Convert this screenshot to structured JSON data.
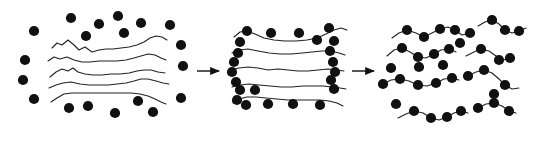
{
  "figure": {
    "type": "schematic-diagram",
    "width": 542,
    "height": 142,
    "background_color": "#ffffff",
    "ink_color": "#111111",
    "chain_stroke_color": "#222222",
    "chain_stroke_width": 1.1,
    "particle_fill": "#111111",
    "particle_radius": 5.1,
    "panel_count": 3,
    "arrow_count": 2,
    "has_text_labels": false
  },
  "panels": [
    {
      "id": "panel-1",
      "name": "immiscible-phase-separated-state",
      "caption": "",
      "chains": [
        "M 52 48 L 57 43 L 62 45 L 68 40 L 74 45 L 79 50 L 85 47 L 92 52 L 99 50 L 106 49 L 113 49 L 121 48 L 129 47 L 137 45 L 144 42 L 150 38 L 156 36 L 162 37 L 167 40",
        "M 48 61 L 54 57 L 60 59 L 67 57 L 74 60 L 82 62 L 90 62 L 99 61 L 108 61 L 117 61 L 126 60 L 134 58 L 141 56 L 148 54 L 155 55 L 161 58 L 166 60",
        "M 50 77 L 56 72 L 62 69 L 68 71 L 73 68 L 78 72 L 85 74 L 93 75 L 102 75 L 111 74 L 120 74 L 129 73 L 137 71 L 144 70 L 151 70 L 158 72 L 165 73",
        "M 49 88 L 56 85 L 63 83 L 71 82 L 80 84 L 89 85 L 98 85 L 108 85 L 117 84 L 126 83 L 134 81 L 141 79 L 148 79 L 156 81 L 163 83 L 169 84",
        "M 51 102 L 57 98 L 64 94 L 72 93 L 81 93 L 91 93 L 101 93 L 111 93 L 121 93 L 131 93 L 140 94 L 148 96 L 155 99 L 161 102 L 166 104"
      ],
      "particles": [
        {
          "cx": 71,
          "cy": 18
        },
        {
          "cx": 99,
          "cy": 24
        },
        {
          "cx": 118,
          "cy": 16
        },
        {
          "cx": 141,
          "cy": 23
        },
        {
          "cx": 34,
          "cy": 31
        },
        {
          "cx": 86,
          "cy": 36
        },
        {
          "cx": 124,
          "cy": 33
        },
        {
          "cx": 170,
          "cy": 25
        },
        {
          "cx": 25,
          "cy": 60
        },
        {
          "cx": 181,
          "cy": 45
        },
        {
          "cx": 23,
          "cy": 80
        },
        {
          "cx": 183,
          "cy": 66
        },
        {
          "cx": 34,
          "cy": 99
        },
        {
          "cx": 181,
          "cy": 98
        },
        {
          "cx": 69,
          "cy": 108
        },
        {
          "cx": 88,
          "cy": 106
        },
        {
          "cx": 115,
          "cy": 113
        },
        {
          "cx": 138,
          "cy": 101
        },
        {
          "cx": 153,
          "cy": 112
        }
      ]
    },
    {
      "id": "panel-2",
      "name": "intercalated-layered-state",
      "caption": "",
      "chains": [
        "M 234 37 L 240 32 L 247 31 L 255 34 L 264 38 L 274 40 L 285 41 L 296 41 L 307 40 L 317 38 L 326 34 L 334 30 L 341 28 L 347 30",
        "M 232 53 L 239 50 L 248 49 L 258 51 L 269 53 L 280 54 L 291 54 L 302 53 L 312 52 L 322 51 L 331 51 L 339 53 L 345 55",
        "M 231 70 L 239 68 L 248 67 L 258 68 L 268 70 L 278 69 L 288 70 L 298 71 L 308 71 L 318 70 L 328 69 L 336 70 L 344 71",
        "M 232 87 L 240 85 L 249 84 L 259 85 L 270 86 L 281 87 L 292 87 L 303 86 L 313 86 L 323 86 L 332 87 L 340 88 L 346 89",
        "M 233 103 L 239 99 L 247 97 L 256 97 L 266 98 L 277 99 L 288 100 L 299 100 L 310 100 L 320 100 L 329 101 L 337 103 L 343 106"
      ],
      "particles": [
        {
          "cx": 247,
          "cy": 31
        },
        {
          "cx": 271,
          "cy": 33
        },
        {
          "cx": 299,
          "cy": 33
        },
        {
          "cx": 329,
          "cy": 28
        },
        {
          "cx": 240,
          "cy": 42
        },
        {
          "cx": 317,
          "cy": 40
        },
        {
          "cx": 334,
          "cy": 41
        },
        {
          "cx": 238,
          "cy": 53
        },
        {
          "cx": 330,
          "cy": 51
        },
        {
          "cx": 234,
          "cy": 62
        },
        {
          "cx": 333,
          "cy": 62
        },
        {
          "cx": 232,
          "cy": 72
        },
        {
          "cx": 335,
          "cy": 72
        },
        {
          "cx": 236,
          "cy": 82
        },
        {
          "cx": 331,
          "cy": 80
        },
        {
          "cx": 240,
          "cy": 90
        },
        {
          "cx": 334,
          "cy": 89
        },
        {
          "cx": 255,
          "cy": 90
        },
        {
          "cx": 237,
          "cy": 100
        },
        {
          "cx": 246,
          "cy": 105
        },
        {
          "cx": 268,
          "cy": 104
        },
        {
          "cx": 293,
          "cy": 104
        },
        {
          "cx": 320,
          "cy": 105
        }
      ]
    },
    {
      "id": "panel-3",
      "name": "exfoliated-dispersed-state",
      "caption": "",
      "chains": [
        "M 392 38 L 399 33 L 407 30 L 416 33 L 424 37 L 432 33 L 440 29 L 448 27 L 455 30 L 462 35 L 470 33",
        "M 478 26 L 485 22 L 492 20 L 499 24 L 505 30 L 512 33 L 519 31 L 526 28",
        "M 387 56 L 394 50 L 402 48 L 410 52 L 418 57 L 426 58 L 434 54 L 441 50 L 449 49 L 456 52",
        "M 466 56 L 474 52 L 481 49 L 489 51 L 496 56 L 503 60 L 510 58",
        "M 383 84 L 391 80 L 400 79 L 409 81 L 418 85 L 427 86 L 436 83 L 444 79 L 452 78 L 459 80",
        "M 468 76 L 476 72 L 484 70 L 492 73 L 499 79 L 505 85 L 512 89 L 519 88",
        "M 398 118 L 406 114 L 414 111 L 423 113 L 431 118 L 439 120 L 447 117 L 454 113 L 461 111 L 468 113",
        "M 478 108 L 486 104 L 494 103 L 502 106 L 509 111 L 516 113"
      ],
      "particles": [
        {
          "cx": 407,
          "cy": 30
        },
        {
          "cx": 424,
          "cy": 37
        },
        {
          "cx": 440,
          "cy": 29
        },
        {
          "cx": 455,
          "cy": 30
        },
        {
          "cx": 470,
          "cy": 33
        },
        {
          "cx": 492,
          "cy": 20
        },
        {
          "cx": 505,
          "cy": 30
        },
        {
          "cx": 519,
          "cy": 31
        },
        {
          "cx": 402,
          "cy": 48
        },
        {
          "cx": 418,
          "cy": 57
        },
        {
          "cx": 434,
          "cy": 54
        },
        {
          "cx": 449,
          "cy": 49
        },
        {
          "cx": 460,
          "cy": 43
        },
        {
          "cx": 481,
          "cy": 49
        },
        {
          "cx": 499,
          "cy": 60
        },
        {
          "cx": 510,
          "cy": 58
        },
        {
          "cx": 391,
          "cy": 68
        },
        {
          "cx": 419,
          "cy": 67
        },
        {
          "cx": 443,
          "cy": 65
        },
        {
          "cx": 484,
          "cy": 70
        },
        {
          "cx": 505,
          "cy": 85
        },
        {
          "cx": 383,
          "cy": 84
        },
        {
          "cx": 400,
          "cy": 79
        },
        {
          "cx": 418,
          "cy": 85
        },
        {
          "cx": 436,
          "cy": 83
        },
        {
          "cx": 452,
          "cy": 78
        },
        {
          "cx": 468,
          "cy": 76
        },
        {
          "cx": 494,
          "cy": 94
        },
        {
          "cx": 396,
          "cy": 104
        },
        {
          "cx": 414,
          "cy": 111
        },
        {
          "cx": 431,
          "cy": 118
        },
        {
          "cx": 447,
          "cy": 117
        },
        {
          "cx": 461,
          "cy": 111
        },
        {
          "cx": 478,
          "cy": 108
        },
        {
          "cx": 494,
          "cy": 103
        },
        {
          "cx": 509,
          "cy": 111
        }
      ]
    }
  ],
  "arrows": [
    {
      "id": "arrow-1",
      "name": "transition-arrow-immiscible-to-intercalated",
      "x1": 197,
      "y1": 71,
      "x2": 219,
      "y2": 71,
      "label": ""
    },
    {
      "id": "arrow-2",
      "name": "transition-arrow-intercalated-to-exfoliated",
      "x1": 352,
      "y1": 71,
      "x2": 374,
      "y2": 71,
      "label": ""
    }
  ]
}
